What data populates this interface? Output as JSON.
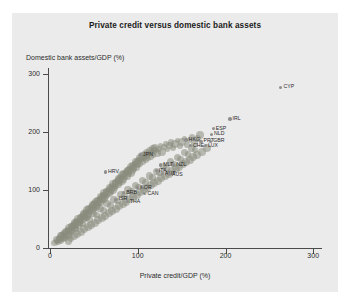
{
  "figure": {
    "title": "Private credit versus domestic bank assets",
    "panel_color": "#ebebeb",
    "background_color": "#ffffff"
  },
  "chart_data": {
    "type": "scatter",
    "title": "Private credit versus domestic bank assets",
    "xlabel": "Private credit/GDP (%)",
    "ylabel": "Domestic bank assets/GDP (%)",
    "xlim": [
      0,
      310
    ],
    "ylim": [
      0,
      310
    ],
    "xticks": [
      0,
      100,
      200,
      300
    ],
    "yticks": [
      0,
      100,
      200,
      300
    ],
    "grid": false,
    "legend": "none",
    "marker_color": "#8a8d7e",
    "marker_opacity": 0.55,
    "labeled_points": [
      {
        "label": "CYP",
        "x": 263,
        "y": 277
      },
      {
        "label": "IRL",
        "x": 205,
        "y": 222
      },
      {
        "label": "ESP",
        "x": 186,
        "y": 206
      },
      {
        "label": "NLD",
        "x": 184,
        "y": 196
      },
      {
        "label": "HKG",
        "x": 155,
        "y": 186
      },
      {
        "label": "PRT",
        "x": 172,
        "y": 184
      },
      {
        "label": "GBR",
        "x": 183,
        "y": 184
      },
      {
        "label": "CHE",
        "x": 160,
        "y": 176
      },
      {
        "label": "LUX",
        "x": 177,
        "y": 176
      },
      {
        "label": "JPN",
        "x": 103,
        "y": 160
      },
      {
        "label": "MLT",
        "x": 126,
        "y": 143
      },
      {
        "label": "NZL",
        "x": 141,
        "y": 143
      },
      {
        "label": "ITA",
        "x": 121,
        "y": 133
      },
      {
        "label": "AUT",
        "x": 128,
        "y": 128
      },
      {
        "label": "AUS",
        "x": 136,
        "y": 127
      },
      {
        "label": "HRV",
        "x": 63,
        "y": 131
      },
      {
        "label": "BRB",
        "x": 84,
        "y": 96
      },
      {
        "label": "CAN",
        "x": 108,
        "y": 94
      },
      {
        "label": "KOR",
        "x": 100,
        "y": 104
      },
      {
        "label": "ISR",
        "x": 75,
        "y": 84
      },
      {
        "label": "THA",
        "x": 88,
        "y": 80
      }
    ],
    "unlabeled_points": [
      {
        "x": 5,
        "y": 9
      },
      {
        "x": 7,
        "y": 12
      },
      {
        "x": 8,
        "y": 14
      },
      {
        "x": 9,
        "y": 11
      },
      {
        "x": 10,
        "y": 17
      },
      {
        "x": 11,
        "y": 15
      },
      {
        "x": 12,
        "y": 20
      },
      {
        "x": 12,
        "y": 13
      },
      {
        "x": 13,
        "y": 22
      },
      {
        "x": 14,
        "y": 18
      },
      {
        "x": 15,
        "y": 24
      },
      {
        "x": 15,
        "y": 16
      },
      {
        "x": 16,
        "y": 26
      },
      {
        "x": 17,
        "y": 21
      },
      {
        "x": 18,
        "y": 29
      },
      {
        "x": 18,
        "y": 19
      },
      {
        "x": 19,
        "y": 27
      },
      {
        "x": 20,
        "y": 32
      },
      {
        "x": 20,
        "y": 23
      },
      {
        "x": 21,
        "y": 30
      },
      {
        "x": 22,
        "y": 35
      },
      {
        "x": 22,
        "y": 25
      },
      {
        "x": 23,
        "y": 33
      },
      {
        "x": 24,
        "y": 38
      },
      {
        "x": 24,
        "y": 28
      },
      {
        "x": 25,
        "y": 36
      },
      {
        "x": 26,
        "y": 41
      },
      {
        "x": 26,
        "y": 31
      },
      {
        "x": 27,
        "y": 39
      },
      {
        "x": 28,
        "y": 44
      },
      {
        "x": 28,
        "y": 34
      },
      {
        "x": 29,
        "y": 42
      },
      {
        "x": 30,
        "y": 47
      },
      {
        "x": 30,
        "y": 37
      },
      {
        "x": 31,
        "y": 45
      },
      {
        "x": 32,
        "y": 50
      },
      {
        "x": 32,
        "y": 40
      },
      {
        "x": 33,
        "y": 48
      },
      {
        "x": 34,
        "y": 53
      },
      {
        "x": 34,
        "y": 43
      },
      {
        "x": 35,
        "y": 51
      },
      {
        "x": 36,
        "y": 56
      },
      {
        "x": 36,
        "y": 46
      },
      {
        "x": 37,
        "y": 54
      },
      {
        "x": 38,
        "y": 59
      },
      {
        "x": 38,
        "y": 49
      },
      {
        "x": 39,
        "y": 57
      },
      {
        "x": 40,
        "y": 62
      },
      {
        "x": 40,
        "y": 52
      },
      {
        "x": 41,
        "y": 60
      },
      {
        "x": 42,
        "y": 65
      },
      {
        "x": 42,
        "y": 55
      },
      {
        "x": 43,
        "y": 63
      },
      {
        "x": 44,
        "y": 68
      },
      {
        "x": 44,
        "y": 58
      },
      {
        "x": 45,
        "y": 66
      },
      {
        "x": 46,
        "y": 71
      },
      {
        "x": 46,
        "y": 61
      },
      {
        "x": 47,
        "y": 69
      },
      {
        "x": 48,
        "y": 74
      },
      {
        "x": 48,
        "y": 64
      },
      {
        "x": 49,
        "y": 72
      },
      {
        "x": 50,
        "y": 77
      },
      {
        "x": 50,
        "y": 67
      },
      {
        "x": 51,
        "y": 75
      },
      {
        "x": 52,
        "y": 80
      },
      {
        "x": 52,
        "y": 70
      },
      {
        "x": 53,
        "y": 78
      },
      {
        "x": 54,
        "y": 83
      },
      {
        "x": 54,
        "y": 73
      },
      {
        "x": 55,
        "y": 81
      },
      {
        "x": 56,
        "y": 86
      },
      {
        "x": 56,
        "y": 76
      },
      {
        "x": 57,
        "y": 84
      },
      {
        "x": 58,
        "y": 89
      },
      {
        "x": 58,
        "y": 79
      },
      {
        "x": 59,
        "y": 87
      },
      {
        "x": 60,
        "y": 92
      },
      {
        "x": 60,
        "y": 82
      },
      {
        "x": 61,
        "y": 90
      },
      {
        "x": 62,
        "y": 95
      },
      {
        "x": 62,
        "y": 85
      },
      {
        "x": 63,
        "y": 93
      },
      {
        "x": 64,
        "y": 98
      },
      {
        "x": 64,
        "y": 88
      },
      {
        "x": 65,
        "y": 96
      },
      {
        "x": 66,
        "y": 101
      },
      {
        "x": 66,
        "y": 91
      },
      {
        "x": 67,
        "y": 99
      },
      {
        "x": 68,
        "y": 104
      },
      {
        "x": 68,
        "y": 94
      },
      {
        "x": 69,
        "y": 102
      },
      {
        "x": 70,
        "y": 107
      },
      {
        "x": 70,
        "y": 97
      },
      {
        "x": 71,
        "y": 105
      },
      {
        "x": 72,
        "y": 110
      },
      {
        "x": 72,
        "y": 100
      },
      {
        "x": 73,
        "y": 108
      },
      {
        "x": 74,
        "y": 113
      },
      {
        "x": 74,
        "y": 103
      },
      {
        "x": 75,
        "y": 111
      },
      {
        "x": 76,
        "y": 116
      },
      {
        "x": 76,
        "y": 106
      },
      {
        "x": 77,
        "y": 114
      },
      {
        "x": 78,
        "y": 119
      },
      {
        "x": 78,
        "y": 109
      },
      {
        "x": 79,
        "y": 117
      },
      {
        "x": 80,
        "y": 122
      },
      {
        "x": 80,
        "y": 112
      },
      {
        "x": 81,
        "y": 120
      },
      {
        "x": 82,
        "y": 125
      },
      {
        "x": 82,
        "y": 115
      },
      {
        "x": 83,
        "y": 123
      },
      {
        "x": 84,
        "y": 128
      },
      {
        "x": 84,
        "y": 118
      },
      {
        "x": 85,
        "y": 126
      },
      {
        "x": 86,
        "y": 131
      },
      {
        "x": 86,
        "y": 121
      },
      {
        "x": 87,
        "y": 129
      },
      {
        "x": 88,
        "y": 134
      },
      {
        "x": 88,
        "y": 124
      },
      {
        "x": 89,
        "y": 132
      },
      {
        "x": 90,
        "y": 137
      },
      {
        "x": 90,
        "y": 127
      },
      {
        "x": 91,
        "y": 135
      },
      {
        "x": 92,
        "y": 140
      },
      {
        "x": 92,
        "y": 130
      },
      {
        "x": 93,
        "y": 138
      },
      {
        "x": 94,
        "y": 143
      },
      {
        "x": 94,
        "y": 133
      },
      {
        "x": 95,
        "y": 141
      },
      {
        "x": 96,
        "y": 146
      },
      {
        "x": 96,
        "y": 136
      },
      {
        "x": 97,
        "y": 144
      },
      {
        "x": 98,
        "y": 149
      },
      {
        "x": 98,
        "y": 139
      },
      {
        "x": 99,
        "y": 147
      },
      {
        "x": 100,
        "y": 152
      },
      {
        "x": 100,
        "y": 142
      },
      {
        "x": 101,
        "y": 150
      },
      {
        "x": 102,
        "y": 155
      },
      {
        "x": 103,
        "y": 145
      },
      {
        "x": 104,
        "y": 153
      },
      {
        "x": 105,
        "y": 158
      },
      {
        "x": 106,
        "y": 148
      },
      {
        "x": 107,
        "y": 156
      },
      {
        "x": 108,
        "y": 161
      },
      {
        "x": 109,
        "y": 151
      },
      {
        "x": 110,
        "y": 159
      },
      {
        "x": 111,
        "y": 164
      },
      {
        "x": 112,
        "y": 154
      },
      {
        "x": 113,
        "y": 162
      },
      {
        "x": 114,
        "y": 167
      },
      {
        "x": 115,
        "y": 157
      },
      {
        "x": 116,
        "y": 165
      },
      {
        "x": 117,
        "y": 170
      },
      {
        "x": 118,
        "y": 160
      },
      {
        "x": 119,
        "y": 168
      },
      {
        "x": 120,
        "y": 173
      },
      {
        "x": 122,
        "y": 163
      },
      {
        "x": 124,
        "y": 171
      },
      {
        "x": 126,
        "y": 176
      },
      {
        "x": 128,
        "y": 166
      },
      {
        "x": 130,
        "y": 174
      },
      {
        "x": 132,
        "y": 179
      },
      {
        "x": 134,
        "y": 169
      },
      {
        "x": 136,
        "y": 177
      },
      {
        "x": 138,
        "y": 182
      },
      {
        "x": 140,
        "y": 172
      },
      {
        "x": 142,
        "y": 180
      },
      {
        "x": 145,
        "y": 185
      },
      {
        "x": 148,
        "y": 175
      },
      {
        "x": 150,
        "y": 183
      },
      {
        "x": 153,
        "y": 188
      },
      {
        "x": 156,
        "y": 178
      },
      {
        "x": 159,
        "y": 186
      },
      {
        "x": 162,
        "y": 191
      },
      {
        "x": 165,
        "y": 181
      },
      {
        "x": 168,
        "y": 189
      },
      {
        "x": 171,
        "y": 194
      },
      {
        "x": 26,
        "y": 36
      },
      {
        "x": 29,
        "y": 33
      },
      {
        "x": 33,
        "y": 44
      },
      {
        "x": 37,
        "y": 41
      },
      {
        "x": 41,
        "y": 52
      },
      {
        "x": 45,
        "y": 49
      },
      {
        "x": 49,
        "y": 60
      },
      {
        "x": 53,
        "y": 57
      },
      {
        "x": 57,
        "y": 68
      },
      {
        "x": 61,
        "y": 65
      },
      {
        "x": 65,
        "y": 76
      },
      {
        "x": 69,
        "y": 73
      },
      {
        "x": 73,
        "y": 84
      },
      {
        "x": 77,
        "y": 81
      },
      {
        "x": 81,
        "y": 92
      },
      {
        "x": 85,
        "y": 89
      },
      {
        "x": 89,
        "y": 100
      },
      {
        "x": 93,
        "y": 97
      },
      {
        "x": 97,
        "y": 108
      },
      {
        "x": 101,
        "y": 105
      },
      {
        "x": 105,
        "y": 116
      },
      {
        "x": 109,
        "y": 113
      },
      {
        "x": 113,
        "y": 124
      },
      {
        "x": 117,
        "y": 121
      },
      {
        "x": 121,
        "y": 132
      },
      {
        "x": 125,
        "y": 129
      },
      {
        "x": 129,
        "y": 140
      },
      {
        "x": 133,
        "y": 137
      },
      {
        "x": 137,
        "y": 148
      },
      {
        "x": 141,
        "y": 145
      },
      {
        "x": 145,
        "y": 156
      },
      {
        "x": 149,
        "y": 153
      },
      {
        "x": 153,
        "y": 164
      },
      {
        "x": 157,
        "y": 161
      },
      {
        "x": 161,
        "y": 172
      },
      {
        "x": 165,
        "y": 169
      },
      {
        "x": 21,
        "y": 12
      },
      {
        "x": 24,
        "y": 16
      },
      {
        "x": 27,
        "y": 20
      },
      {
        "x": 31,
        "y": 24
      },
      {
        "x": 35,
        "y": 28
      },
      {
        "x": 39,
        "y": 32
      },
      {
        "x": 43,
        "y": 36
      },
      {
        "x": 47,
        "y": 40
      },
      {
        "x": 51,
        "y": 44
      },
      {
        "x": 55,
        "y": 48
      },
      {
        "x": 59,
        "y": 52
      },
      {
        "x": 63,
        "y": 56
      },
      {
        "x": 67,
        "y": 60
      },
      {
        "x": 71,
        "y": 64
      },
      {
        "x": 75,
        "y": 68
      },
      {
        "x": 79,
        "y": 72
      },
      {
        "x": 83,
        "y": 76
      },
      {
        "x": 87,
        "y": 80
      },
      {
        "x": 91,
        "y": 84
      },
      {
        "x": 95,
        "y": 88
      },
      {
        "x": 99,
        "y": 92
      },
      {
        "x": 103,
        "y": 96
      },
      {
        "x": 107,
        "y": 100
      },
      {
        "x": 111,
        "y": 104
      },
      {
        "x": 115,
        "y": 108
      },
      {
        "x": 119,
        "y": 112
      },
      {
        "x": 123,
        "y": 116
      },
      {
        "x": 127,
        "y": 120
      },
      {
        "x": 131,
        "y": 124
      },
      {
        "x": 135,
        "y": 128
      },
      {
        "x": 139,
        "y": 132
      },
      {
        "x": 143,
        "y": 136
      },
      {
        "x": 147,
        "y": 140
      },
      {
        "x": 151,
        "y": 144
      },
      {
        "x": 155,
        "y": 148
      },
      {
        "x": 159,
        "y": 152
      },
      {
        "x": 163,
        "y": 156
      },
      {
        "x": 167,
        "y": 160
      },
      {
        "x": 173,
        "y": 166
      },
      {
        "x": 179,
        "y": 172
      }
    ]
  }
}
